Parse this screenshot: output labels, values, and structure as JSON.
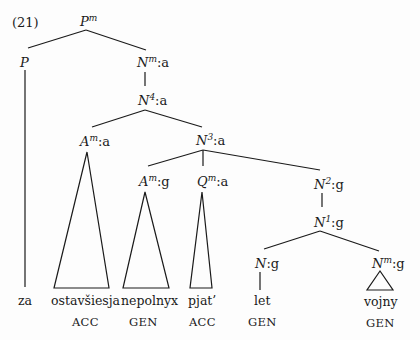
{
  "example_number": "(21)",
  "nodes": {
    "root": {
      "cat": "P",
      "sup": "m",
      "feat": ""
    },
    "p": {
      "cat": "P",
      "sup": "",
      "feat": ""
    },
    "nm_a": {
      "cat": "N",
      "sup": "m",
      "feat": ":a"
    },
    "n4_a": {
      "cat": "N",
      "sup": "4",
      "feat": ":a"
    },
    "am_a": {
      "cat": "A",
      "sup": "m",
      "feat": ":a"
    },
    "n3_a": {
      "cat": "N",
      "sup": "3",
      "feat": ":a"
    },
    "am_g": {
      "cat": "A",
      "sup": "m",
      "feat": ":g"
    },
    "qm_a": {
      "cat": "Q",
      "sup": "m",
      "feat": ":a"
    },
    "n2_g": {
      "cat": "N",
      "sup": "2",
      "feat": ":g"
    },
    "n1_g": {
      "cat": "N",
      "sup": "1",
      "feat": ":g"
    },
    "n_g": {
      "cat": "N",
      "sup": "",
      "feat": ":g"
    },
    "nm_g": {
      "cat": "N",
      "sup": "m",
      "feat": ":g"
    }
  },
  "words": [
    "za",
    "ostavšiesja",
    "nepolnyx",
    "pjat’",
    "let",
    "vojny"
  ],
  "cases": [
    "ACC",
    "GEN",
    "ACC",
    "GEN",
    "GEN"
  ],
  "colors": {
    "ink": "#1a1a1a",
    "background": "#fdfdfd"
  }
}
